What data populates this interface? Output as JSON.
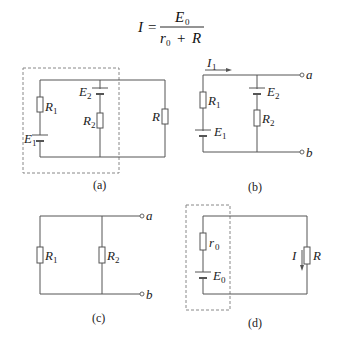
{
  "formula": {
    "lhs": "I",
    "equals": "=",
    "numerator": "E",
    "numerator_sub": "0",
    "denominator_a": "r",
    "denominator_a_sub": "0",
    "plus": "+",
    "denominator_b": "R"
  },
  "diagrams": {
    "a": {
      "caption": "(a)",
      "labels": {
        "R1": "R",
        "R1_sub": "1",
        "E1": "E",
        "E1_sub": "1",
        "E2": "E",
        "E2_sub": "2",
        "R2": "R",
        "R2_sub": "2",
        "R": "R"
      }
    },
    "b": {
      "caption": "(b)",
      "labels": {
        "I1": "I",
        "I1_sub": "1",
        "R1": "R",
        "R1_sub": "1",
        "E1": "E",
        "E1_sub": "1",
        "E2": "E",
        "E2_sub": "2",
        "R2": "R",
        "R2_sub": "2",
        "a": "a",
        "b": "b"
      }
    },
    "c": {
      "caption": "(c)",
      "labels": {
        "R1": "R",
        "R1_sub": "1",
        "R2": "R",
        "R2_sub": "2",
        "a": "a",
        "b": "b"
      }
    },
    "d": {
      "caption": "(d)",
      "labels": {
        "r0": "r",
        "r0_sub": "0",
        "E0": "E",
        "E0_sub": "0",
        "I": "I",
        "R": "R"
      }
    }
  }
}
